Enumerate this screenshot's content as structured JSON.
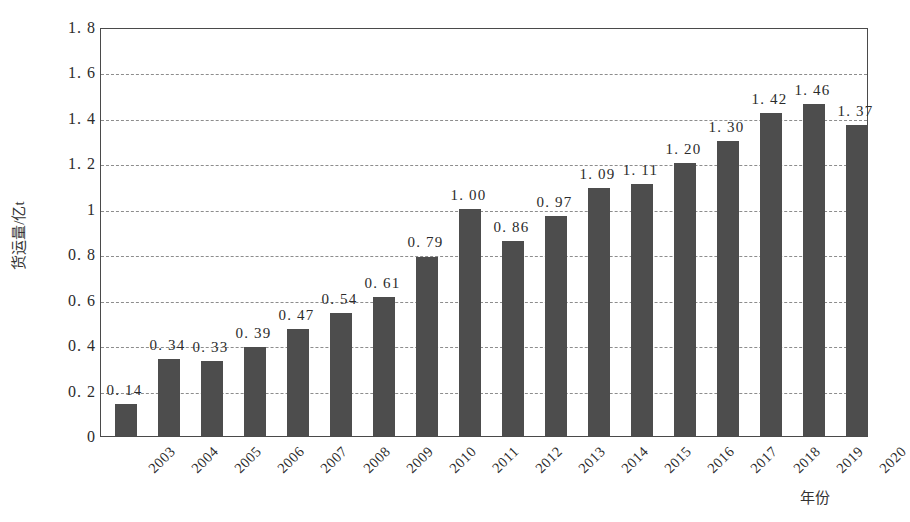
{
  "chart_data": {
    "type": "bar",
    "title": "",
    "subtitle": "",
    "xlabel": "年份",
    "ylabel": "货运量/亿t",
    "categories": [
      "2003",
      "2004",
      "2005",
      "2006",
      "2007",
      "2008",
      "2009",
      "2010",
      "2011",
      "2012",
      "2013",
      "2014",
      "2015",
      "2016",
      "2017",
      "2018",
      "2019",
      "2020"
    ],
    "values": [
      0.14,
      0.34,
      0.33,
      0.39,
      0.47,
      0.54,
      0.61,
      0.79,
      1.0,
      0.86,
      0.97,
      1.09,
      1.11,
      1.2,
      1.3,
      1.42,
      1.46,
      1.37
    ],
    "value_labels": [
      "0. 14",
      "0. 34",
      "0. 33",
      "0. 39",
      "0. 47",
      "0. 54",
      "0. 61",
      "0. 79",
      "1. 00",
      "0. 86",
      "0. 97",
      "1. 09",
      "1. 11",
      "1. 20",
      "1. 30",
      "1. 42",
      "1. 46",
      "1. 37"
    ],
    "ylim": [
      0,
      1.8
    ],
    "y_ticks": [
      0,
      0.2,
      0.4,
      0.6,
      0.8,
      1.0,
      1.2,
      1.4,
      1.6,
      1.8
    ],
    "y_tick_labels": [
      "0",
      "0. 2",
      "0. 4",
      "0. 6",
      "0. 8",
      "1",
      "1. 2",
      "1. 4",
      "1. 6",
      "1. 8"
    ],
    "gridlines_at": [
      0.2,
      0.4,
      0.6,
      0.8,
      1.0,
      1.2,
      1.4,
      1.6
    ],
    "grid": true,
    "legend": "none",
    "bar_color": "#4d4d4d",
    "grid_color": "#8d8d8d",
    "axis_color": "#4a4a4a",
    "background_color": "#ffffff"
  }
}
